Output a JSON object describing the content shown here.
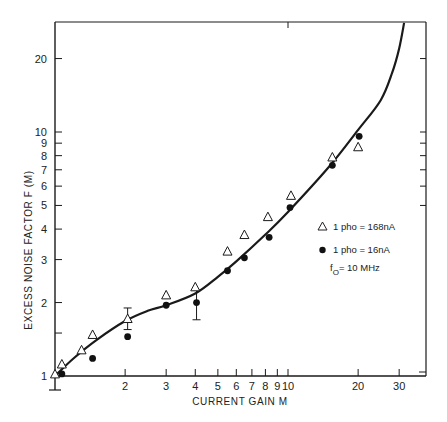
{
  "chart_data": {
    "type": "scatter",
    "title": "",
    "xlabel": "CURRENT GAIN M",
    "ylabel": "EXCESS NOISE FACTOR F (M)",
    "xscale": "log",
    "yscale": "log",
    "xlim": [
      1,
      37
    ],
    "ylim": [
      1,
      28
    ],
    "grid": false,
    "x_ticks": [
      {
        "value": 1,
        "label": ""
      },
      {
        "value": 2,
        "label": "2"
      },
      {
        "value": 3,
        "label": "3"
      },
      {
        "value": 4,
        "label": "4"
      },
      {
        "value": 5,
        "label": "5"
      },
      {
        "value": 6,
        "label": "6"
      },
      {
        "value": 7,
        "label": "7"
      },
      {
        "value": 8,
        "label": "8"
      },
      {
        "value": 9,
        "label": "9"
      },
      {
        "value": 10,
        "label": "10"
      },
      {
        "value": 20,
        "label": "20"
      },
      {
        "value": 30,
        "label": "30"
      }
    ],
    "y_ticks": [
      {
        "value": 1,
        "label": "1"
      },
      {
        "value": 1.5,
        "label": ""
      },
      {
        "value": 2,
        "label": "2"
      },
      {
        "value": 3,
        "label": "3"
      },
      {
        "value": 4,
        "label": "4"
      },
      {
        "value": 5,
        "label": "5"
      },
      {
        "value": 6,
        "label": "6"
      },
      {
        "value": 7,
        "label": "7"
      },
      {
        "value": 8,
        "label": "8"
      },
      {
        "value": 9,
        "label": "9"
      },
      {
        "value": 10,
        "label": "10"
      },
      {
        "value": 20,
        "label": "20"
      }
    ],
    "series": [
      {
        "name": "1 pho = 168nA",
        "marker": "open-triangle",
        "points": [
          [
            1.0,
            1.02
          ],
          [
            1.07,
            1.12
          ],
          [
            1.3,
            1.28
          ],
          [
            1.45,
            1.48
          ],
          [
            2.05,
            1.72
          ],
          [
            3.0,
            2.15
          ],
          [
            4.0,
            2.32
          ],
          [
            5.5,
            3.25
          ],
          [
            6.5,
            3.8
          ],
          [
            8.2,
            4.5
          ],
          [
            10.3,
            5.5
          ],
          [
            15.5,
            7.9
          ],
          [
            20.0,
            8.7
          ]
        ],
        "error_bars": [
          {
            "x": 2.05,
            "low": 1.55,
            "high": 1.9
          }
        ]
      },
      {
        "name": "1 pho = 16nA",
        "marker": "filled-circle",
        "points": [
          [
            1.07,
            1.02
          ],
          [
            1.45,
            1.18
          ],
          [
            2.05,
            1.45
          ],
          [
            3.0,
            1.95
          ],
          [
            4.05,
            2.0
          ],
          [
            5.5,
            2.7
          ],
          [
            6.5,
            3.05
          ],
          [
            8.3,
            3.7
          ],
          [
            10.2,
            4.9
          ],
          [
            15.5,
            7.3
          ],
          [
            20.2,
            9.6
          ]
        ],
        "error_bars": [
          {
            "x": 4.05,
            "low": 1.7,
            "high": 2.25
          }
        ]
      },
      {
        "name": "theory curve",
        "marker": "line",
        "points": [
          [
            1.0,
            1.0
          ],
          [
            1.2,
            1.18
          ],
          [
            1.5,
            1.4
          ],
          [
            2.0,
            1.68
          ],
          [
            2.5,
            1.85
          ],
          [
            3.0,
            1.95
          ],
          [
            4.0,
            2.18
          ],
          [
            5.0,
            2.55
          ],
          [
            6.0,
            2.95
          ],
          [
            8.0,
            3.8
          ],
          [
            10.0,
            4.7
          ],
          [
            15.0,
            7.2
          ],
          [
            20.0,
            10.2
          ],
          [
            25.0,
            13.5
          ],
          [
            28.0,
            17.5
          ],
          [
            30.0,
            22.0
          ],
          [
            31.5,
            28.0
          ]
        ]
      }
    ],
    "legend": {
      "position": "right-middle",
      "entries": [
        {
          "marker": "open-triangle",
          "label": "1 pho = 168nA"
        },
        {
          "marker": "filled-circle",
          "label": "1 pho = 16nA"
        }
      ],
      "annotation_main": "f",
      "annotation_sub": "O",
      "annotation_rest": "= 10 MHz"
    }
  },
  "axes": {
    "xlabel": "CURRENT GAIN M",
    "ylabel": "EXCESS NOISE FACTOR F (M)"
  },
  "legend": {
    "entry_1": "1 pho = 168nA",
    "entry_2": "1 pho = 16nA",
    "freq_main": "f",
    "freq_sub": "O",
    "freq_rest": "= 10 MHz"
  }
}
